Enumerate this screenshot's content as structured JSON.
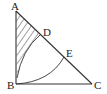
{
  "diagram": {
    "type": "geometry",
    "points": {
      "A": {
        "label": "A",
        "x": 16,
        "y": 11
      },
      "B": {
        "label": "B",
        "x": 16,
        "y": 84
      },
      "C": {
        "label": "C",
        "x": 92,
        "y": 84
      },
      "D": {
        "label": "D",
        "x": 40,
        "y": 35
      },
      "E": {
        "label": "E",
        "x": 64,
        "y": 57
      }
    },
    "colors": {
      "line": "#333333",
      "hatch": "#444444"
    }
  }
}
